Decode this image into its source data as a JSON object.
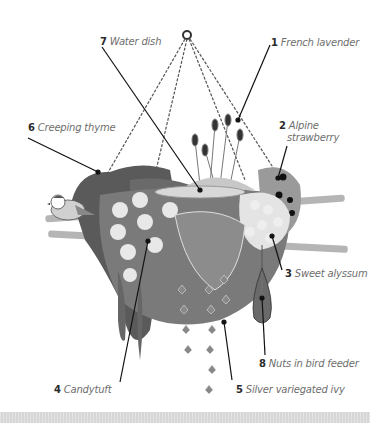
{
  "diagram": {
    "type": "labeled-illustration",
    "colors": {
      "background": "#ffffff",
      "line": "#1a1a1a",
      "label_text": "#6e6e6e",
      "label_number": "#2a2a2a",
      "foliage_dark": "#5a5a5a",
      "foliage_mid": "#8a8a8a",
      "flower_light": "#e6e6e6",
      "caption_band": "#d6d6d6"
    },
    "labels": [
      {
        "number": "1",
        "text": "French lavender"
      },
      {
        "number": "2",
        "text": "Alpine",
        "text2": "strawberry"
      },
      {
        "number": "3",
        "text": "Sweet alyssum"
      },
      {
        "number": "4",
        "text": "Candytuft"
      },
      {
        "number": "5",
        "text": "Silver variegated ivy"
      },
      {
        "number": "6",
        "text": "Creeping thyme"
      },
      {
        "number": "7",
        "text": "Water dish"
      },
      {
        "number": "8",
        "text": "Nuts in bird feeder"
      }
    ]
  },
  "caption": {
    "text": "Hanging basket planting scheme (text clipped at edge)"
  }
}
